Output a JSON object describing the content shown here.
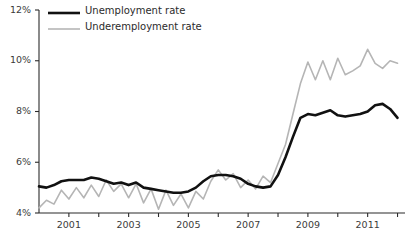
{
  "chart_data": {
    "type": "line",
    "title": "",
    "subtitle": "",
    "xlabel": "",
    "ylabel": "",
    "grid": false,
    "legend_position": "top-left",
    "xlim": [
      2000.0,
      2012.25
    ],
    "ylim": [
      4,
      12
    ],
    "ytick_labels": [
      "4%",
      "6%",
      "8%",
      "10%",
      "12%"
    ],
    "ytick_values": [
      4,
      6,
      8,
      10,
      12
    ],
    "xtick_labels": [
      "2001",
      "2003",
      "2005",
      "2007",
      "2009",
      "2011"
    ],
    "xtick_values": [
      2001,
      2003,
      2005,
      2007,
      2009,
      2011
    ],
    "xtick_minor_values": [
      2002,
      2004,
      2006,
      2008,
      2010,
      2012
    ],
    "x": [
      2000.0,
      2000.25,
      2000.5,
      2000.75,
      2001.0,
      2001.25,
      2001.5,
      2001.75,
      2002.0,
      2002.25,
      2002.5,
      2002.75,
      2003.0,
      2003.25,
      2003.5,
      2003.75,
      2004.0,
      2004.25,
      2004.5,
      2004.75,
      2005.0,
      2005.25,
      2005.5,
      2005.75,
      2006.0,
      2006.25,
      2006.5,
      2006.75,
      2007.0,
      2007.25,
      2007.5,
      2007.75,
      2008.0,
      2008.25,
      2008.5,
      2008.75,
      2009.0,
      2009.25,
      2009.5,
      2009.75,
      2010.0,
      2010.25,
      2010.5,
      2010.75,
      2011.0,
      2011.25,
      2011.5,
      2011.75,
      2012.0
    ],
    "series": [
      {
        "name": "Unemployment rate",
        "color": "#111111",
        "line_width": 2.6,
        "values": [
          5.05,
          5.0,
          5.1,
          5.25,
          5.3,
          5.3,
          5.3,
          5.4,
          5.35,
          5.25,
          5.15,
          5.2,
          5.1,
          5.2,
          5.0,
          4.95,
          4.9,
          4.85,
          4.8,
          4.8,
          4.85,
          5.0,
          5.25,
          5.45,
          5.5,
          5.5,
          5.45,
          5.35,
          5.15,
          5.05,
          5.0,
          5.05,
          5.5,
          6.2,
          7.0,
          7.75,
          7.9,
          7.85,
          7.95,
          8.05,
          7.85,
          7.8,
          7.85,
          7.9,
          8.0,
          8.25,
          8.3,
          8.1,
          7.75
        ]
      },
      {
        "name": "Underemployment rate",
        "color": "#b5b5b5",
        "line_width": 1.6,
        "values": [
          4.2,
          4.5,
          4.35,
          4.9,
          4.55,
          5.0,
          4.6,
          5.1,
          4.65,
          5.3,
          4.85,
          5.15,
          4.6,
          5.15,
          4.4,
          4.95,
          4.15,
          4.9,
          4.3,
          4.75,
          4.2,
          4.85,
          4.55,
          5.25,
          5.7,
          5.3,
          5.55,
          5.0,
          5.3,
          4.95,
          5.45,
          5.2,
          5.95,
          6.7,
          7.9,
          9.1,
          9.95,
          9.25,
          10.0,
          9.25,
          10.1,
          9.45,
          9.6,
          9.8,
          10.45,
          9.9,
          9.7,
          10.0,
          9.9
        ]
      }
    ]
  },
  "legend": {
    "entries": [
      {
        "label": "Unemployment rate"
      },
      {
        "label": "Underemployment rate"
      }
    ]
  }
}
